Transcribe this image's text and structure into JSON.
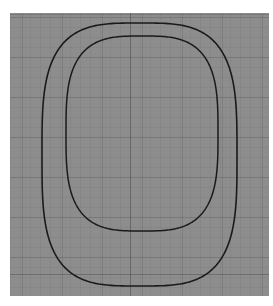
{
  "app": {
    "name": "geometry-viewport",
    "background_color": "#ffffff"
  },
  "viewport": {
    "name": "cad-drawing-canvas",
    "background_color": "#8d8d8d",
    "x": 10,
    "y": 13,
    "width": 259,
    "height": 283,
    "grid": {
      "visible": true,
      "minor_spacing_px": 10,
      "major_spacing_px": 40,
      "minor_color": "rgba(0,0,0,0.045)",
      "major_color": "rgba(0,0,0,0.10)",
      "axis_color": "rgba(0,0,0,0.22)"
    },
    "axes": {
      "horizontal_axis_y": 274,
      "vertical_axis_x": 130
    }
  },
  "chart_data": {
    "type": "line",
    "title": "",
    "subtitle": "",
    "xlabel": "",
    "ylabel": "",
    "grid": true,
    "legend_position": "none",
    "xlim": [
      10,
      269
    ],
    "ylim": [
      13,
      296
    ],
    "series": [
      {
        "name": "outer-superellipse",
        "stroke": "#1a1a1a",
        "stroke_width": 1.6,
        "closed": true,
        "bbox": {
          "left": 42,
          "top": 23,
          "right": 237,
          "bottom": 286
        },
        "center": [
          139.5,
          154.5
        ],
        "semi_width": 97.5,
        "semi_height": 131.5,
        "exponent": 3.4,
        "note": "outer rounded-rectangle / superellipse contour"
      },
      {
        "name": "inner-superellipse",
        "stroke": "#1a1a1a",
        "stroke_width": 1.5,
        "closed": true,
        "bbox": {
          "left": 66,
          "top": 36,
          "right": 218,
          "bottom": 231
        },
        "center": [
          142.0,
          133.5
        ],
        "semi_width": 76.0,
        "semi_height": 97.5,
        "exponent": 3.2,
        "note": "inner rounded-rectangle / superellipse contour, offset inward"
      }
    ]
  },
  "labels": {
    "outer_curve": "Outer contour",
    "inner_curve": "Inner contour"
  }
}
